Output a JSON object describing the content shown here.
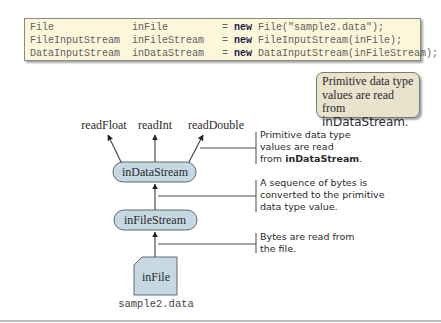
{
  "code": {
    "lines": [
      {
        "type": "File",
        "var": "inFile",
        "pad_type": "File             ",
        "pad_var": "inFile         ",
        "eq": "= ",
        "kw": "new",
        "rest": " File(\"sample2.data\");"
      },
      {
        "type": "FileInputStream",
        "var": "inFileStream",
        "pad_type": "FileInputStream  ",
        "pad_var": "inFileStream   ",
        "eq": "= ",
        "kw": "new",
        "rest": " FileInputStream(inFile);"
      },
      {
        "type": "DataInputStream",
        "var": "inDataStream",
        "pad_type": "DataInputStream  ",
        "pad_var": "inDataStream   ",
        "eq": "= ",
        "kw": "new",
        "rest": " DataInputStream(inFileStream);"
      }
    ]
  },
  "callout": {
    "line1": "Primitive data type",
    "line2": "values are read from",
    "line3": "inDataStream",
    "line3_suffix": "."
  },
  "diagram": {
    "methods": [
      "readFloat",
      "readInt",
      "readDouble"
    ],
    "data_stream_label": "inDataStream",
    "file_stream_label": "inFileStream",
    "file_label": "inFile",
    "file_name": "sample2.data",
    "colors": {
      "node_fill": "#c6d9e2",
      "node_stroke": "#5a6a70",
      "line": "#4a4a4a"
    }
  },
  "notes": [
    {
      "lines": [
        "Primitive data type",
        "values are read"
      ],
      "last_prefix": "from ",
      "last_bold": "inDataStream",
      "last_suffix": "."
    },
    {
      "lines": [
        "A sequence of bytes is",
        "converted to the primitive",
        "data type value."
      ]
    },
    {
      "lines": [
        "Bytes are read from",
        "the file."
      ]
    }
  ]
}
